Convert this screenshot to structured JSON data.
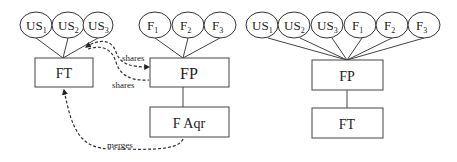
{
  "left_diagram": {
    "ellipses": [
      {
        "base": "US",
        "sub": "1",
        "cx": 36,
        "cy": 25
      },
      {
        "base": "US",
        "sub": "2",
        "cx": 68,
        "cy": 25
      },
      {
        "base": "US",
        "sub": "3",
        "cx": 98,
        "cy": 25
      },
      {
        "base": "F",
        "sub": "1",
        "cx": 155,
        "cy": 25
      },
      {
        "base": "F",
        "sub": "2",
        "cx": 188,
        "cy": 25
      },
      {
        "base": "F",
        "sub": "3",
        "cx": 220,
        "cy": 25
      }
    ],
    "boxes": {
      "ft": "FT",
      "fp": "FP",
      "faqr": "F Aqr"
    },
    "edge_labels": {
      "shares_top": "shares",
      "shares_bottom": "shares",
      "merges": "merges"
    }
  },
  "right_diagram": {
    "ellipses": [
      {
        "base": "US",
        "sub": "1",
        "cx": 262,
        "cy": 25
      },
      {
        "base": "US",
        "sub": "2",
        "cx": 294,
        "cy": 25
      },
      {
        "base": "US",
        "sub": "3",
        "cx": 327,
        "cy": 25
      },
      {
        "base": "F",
        "sub": "1",
        "cx": 360,
        "cy": 25
      },
      {
        "base": "F",
        "sub": "2",
        "cx": 392,
        "cy": 25
      },
      {
        "base": "F",
        "sub": "3",
        "cx": 424,
        "cy": 25
      }
    ],
    "boxes": {
      "fp": "FP",
      "ft": "FT"
    }
  }
}
